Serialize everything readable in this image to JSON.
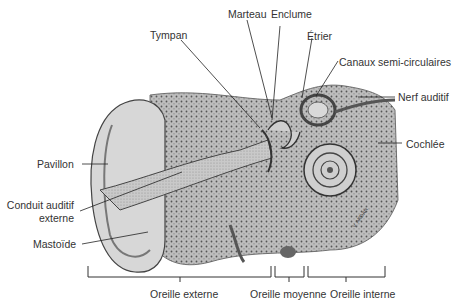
{
  "diagram": {
    "labels": {
      "marteau": "Marteau",
      "enclume": "Enclume",
      "tympan": "Tympan",
      "etrier": "Étrier",
      "canaux": "Canaux semi-circulaires",
      "nerf": "Nerf auditif",
      "cochlee": "Cochlée",
      "pavillon": "Pavillon",
      "conduit_1": "Conduit auditif",
      "conduit_2": "externe",
      "mastoide": "Mastoïde"
    },
    "sections": {
      "externe": "Oreille externe",
      "moyenne": "Oreille moyenne",
      "interne": "Oreille interne"
    },
    "signature": "V. Ardan"
  }
}
